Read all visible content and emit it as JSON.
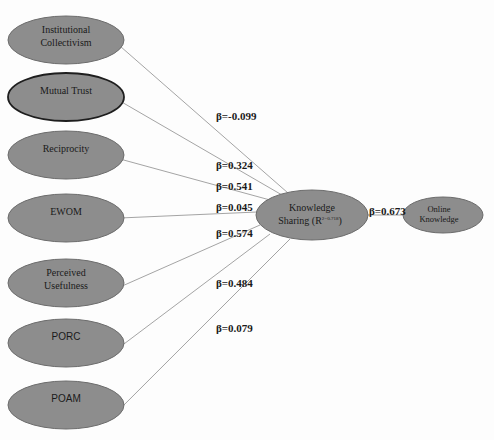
{
  "diagram": {
    "title": "",
    "fill_color": "#8d8d8d",
    "edge_color": "#9a9a9a",
    "predictors": [
      {
        "id": "institutional-collectivism",
        "lines": [
          "Institutional",
          "Collectivism"
        ],
        "beta": "β=-0.099",
        "emphasized": false,
        "font": "serif"
      },
      {
        "id": "mutual-trust",
        "lines": [
          "Mutual Trust"
        ],
        "beta": "β=0.324",
        "emphasized": true,
        "font": "serif"
      },
      {
        "id": "reciprocity",
        "lines": [
          "Reciprocity"
        ],
        "beta": "β=0.541",
        "emphasized": false,
        "font": "serif"
      },
      {
        "id": "ewom",
        "lines": [
          "EWOM"
        ],
        "beta": "β=0.045",
        "emphasized": false,
        "font": "serif"
      },
      {
        "id": "perceived-usefulness",
        "lines": [
          "Perceived",
          "Usefulness"
        ],
        "beta": "β=0.574",
        "emphasized": false,
        "font": "serif"
      },
      {
        "id": "porc",
        "lines": [
          "PORC"
        ],
        "beta": "β=0.484",
        "emphasized": false,
        "font": "sans"
      },
      {
        "id": "poam",
        "lines": [
          "POAM"
        ],
        "beta": "β=0.079",
        "emphasized": false,
        "font": "sans"
      }
    ],
    "mediator": {
      "id": "knowledge-sharing",
      "line1": "Knowledge",
      "line2": "Sharing (R",
      "superscript": "2=0.718",
      "line2_end": ")"
    },
    "outcome": {
      "id": "online-knowledge",
      "lines": [
        "Online",
        "Knowledge"
      ],
      "beta": "β=0.673"
    }
  }
}
